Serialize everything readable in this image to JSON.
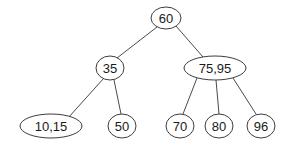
{
  "diagram": {
    "type": "tree",
    "canvas": {
      "width": 288,
      "height": 146
    },
    "colors": {
      "background": "#ffffff",
      "node_stroke": "#3d3d3d",
      "node_fill": "#ffffff",
      "edge_stroke": "#4a4a4a",
      "text": "#1a1a1a"
    },
    "nodes": [
      {
        "id": "root",
        "label": "60",
        "cx": 166,
        "cy": 18,
        "rx": 15,
        "ry": 11,
        "level": 0
      },
      {
        "id": "n35",
        "label": "35",
        "cx": 110,
        "cy": 68,
        "rx": 14,
        "ry": 12,
        "level": 1
      },
      {
        "id": "n7595",
        "label": "75,95",
        "cx": 215,
        "cy": 68,
        "rx": 31,
        "ry": 12,
        "level": 1
      },
      {
        "id": "n1015",
        "label": "10,15",
        "cx": 51,
        "cy": 126,
        "rx": 31,
        "ry": 12,
        "level": 2
      },
      {
        "id": "n50",
        "label": "50",
        "cx": 122,
        "cy": 126,
        "rx": 14,
        "ry": 12,
        "level": 2
      },
      {
        "id": "n70",
        "label": "70",
        "cx": 180,
        "cy": 126,
        "rx": 14,
        "ry": 12,
        "level": 2
      },
      {
        "id": "n80",
        "label": "80",
        "cx": 219,
        "cy": 126,
        "rx": 14,
        "ry": 12,
        "level": 2
      },
      {
        "id": "n96",
        "label": "96",
        "cx": 261,
        "cy": 126,
        "rx": 14,
        "ry": 12,
        "level": 2
      }
    ],
    "edges": [
      {
        "id": "e-root-35",
        "from": "root",
        "to": "n35",
        "x1": 157,
        "y1": 27,
        "x2": 117,
        "y2": 58
      },
      {
        "id": "e-root-7595",
        "from": "root",
        "to": "n7595",
        "x1": 176,
        "y1": 26,
        "x2": 203,
        "y2": 57
      },
      {
        "id": "e-35-1015",
        "from": "n35",
        "to": "n1015",
        "x1": 104,
        "y1": 78,
        "x2": 68,
        "y2": 118
      },
      {
        "id": "e-35-50",
        "from": "n35",
        "to": "n50",
        "x1": 114,
        "y1": 80,
        "x2": 121,
        "y2": 114
      },
      {
        "id": "e-7595-70",
        "from": "n7595",
        "to": "n70",
        "x1": 197,
        "y1": 78,
        "x2": 183,
        "y2": 114
      },
      {
        "id": "e-7595-80",
        "from": "n7595",
        "to": "n80",
        "x1": 216,
        "y1": 80,
        "x2": 219,
        "y2": 114
      },
      {
        "id": "e-7595-96",
        "from": "n7595",
        "to": "n96",
        "x1": 233,
        "y1": 78,
        "x2": 256,
        "y2": 114
      }
    ]
  }
}
